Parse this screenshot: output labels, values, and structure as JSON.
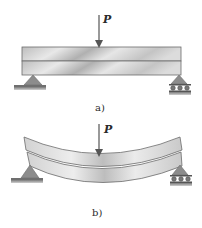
{
  "figure": {
    "panels": [
      {
        "id": "a",
        "caption": "a)",
        "load_label": "P",
        "beam_state": "undeformed, two stacked layers",
        "supports": {
          "left": "pin",
          "right": "roller"
        }
      },
      {
        "id": "b",
        "caption": "b)",
        "load_label": "P",
        "beam_state": "bent, layers slide relative to each other",
        "supports": {
          "left": "pin",
          "right": "roller"
        }
      }
    ],
    "colors": {
      "beam_light": "#e4e4e4",
      "beam_dark": "#a9a9a9",
      "beam_outline": "#6b6b6b",
      "support_fill": "#8c8c8c",
      "ground": "#9a9a9a",
      "arrow": "#555555",
      "text": "#2a2a2a"
    }
  }
}
